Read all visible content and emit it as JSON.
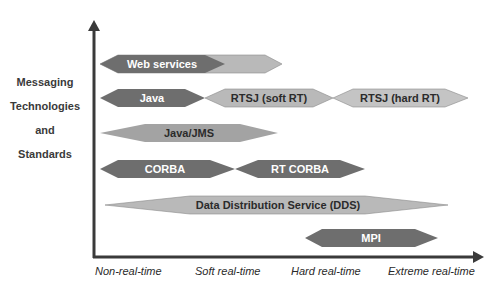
{
  "diagram": {
    "y_axis_label_lines": [
      "Messaging",
      "Technologies",
      "and",
      "Standards"
    ],
    "x_axis_labels": [
      "Non-real-time",
      "Soft real-time",
      "Hard real-time",
      "Extreme real-time"
    ],
    "colors": {
      "dark": "#6e6e6e",
      "light": "#b9b9b9",
      "dark_text": "#ffffff",
      "light_text": "#2b2b2b",
      "axis": "#3a3a3a"
    },
    "technologies": [
      {
        "label": "Web services",
        "row": 1
      },
      {
        "label": "Java",
        "row": 2
      },
      {
        "label": "RTSJ (soft RT)",
        "row": 2
      },
      {
        "label": "RTSJ (hard RT)",
        "row": 2
      },
      {
        "label": "Java/JMS",
        "row": 3
      },
      {
        "label": "CORBA",
        "row": 4
      },
      {
        "label": "RT CORBA",
        "row": 4
      },
      {
        "label": "Data Distribution Service (DDS)",
        "row": 5
      },
      {
        "label": "MPI",
        "row": 6
      }
    ]
  }
}
